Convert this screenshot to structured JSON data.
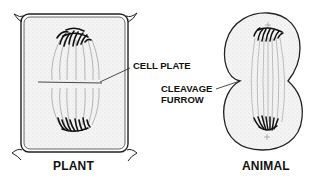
{
  "diagram": {
    "topic": "Cytokinesis in plant and animal cells",
    "panels": [
      {
        "id": "plant",
        "title": "PLANT",
        "callout": "CELL PLATE"
      },
      {
        "id": "animal",
        "title": "ANIMAL",
        "callout_line1": "CLEAVAGE",
        "callout_line2": "FURROW"
      }
    ],
    "colors": {
      "ink": "#111111",
      "stipple": "#bdbdbd",
      "spindle": "#9a9a9a",
      "background": "#ffffff"
    }
  }
}
